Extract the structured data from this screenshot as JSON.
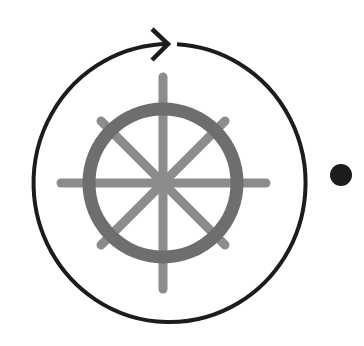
{
  "diagram": {
    "colors": {
      "background": "#ffffff",
      "orbit_ring": "#1c1c1c",
      "wheel_rim": "#6e6e6e",
      "wheel_spokes": "#8c8c8c",
      "dot": "#1c1c1c"
    },
    "icons": [
      "ship-wheel-icon",
      "rotate-clockwise-arrow-icon",
      "dot-icon"
    ]
  }
}
